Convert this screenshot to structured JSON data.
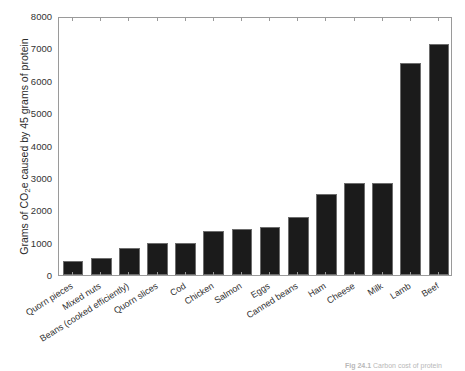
{
  "chart_data": {
    "type": "bar",
    "title": "",
    "xlabel": "",
    "ylabel": "Grams of CO2e caused by 45 grams of protein",
    "ylabel_parts": {
      "before": "Grams of CO",
      "subscript": "2",
      "after": "e caused by 45 grams of protein"
    },
    "ylim": [
      0,
      8000
    ],
    "ytick_labels": [
      "0",
      "1000",
      "2000",
      "3000",
      "4000",
      "5000",
      "6000",
      "7000",
      "8000"
    ],
    "ytick_values": [
      0,
      1000,
      2000,
      3000,
      4000,
      5000,
      6000,
      7000,
      8000
    ],
    "grid": false,
    "legend": null,
    "bar_color": "#1b1b1b",
    "bar_edge_color": "#6d6d6d",
    "axis_color": "#9a9a9a",
    "categories": [
      "Quorn pieces",
      "Mixed nuts",
      "Beans (cooked efficiently)",
      "Quorn slices",
      "Cod",
      "Chicken",
      "Salmon",
      "Eggs",
      "Canned beans",
      "Ham",
      "Cheese",
      "Milk",
      "Lamb",
      "Beef"
    ],
    "values": [
      430,
      530,
      830,
      1000,
      1000,
      1350,
      1430,
      1470,
      1800,
      2500,
      2830,
      2830,
      6550,
      7130
    ]
  },
  "caption": {
    "label": "Fig 24.1",
    "text": " Carbon cost of protein"
  }
}
